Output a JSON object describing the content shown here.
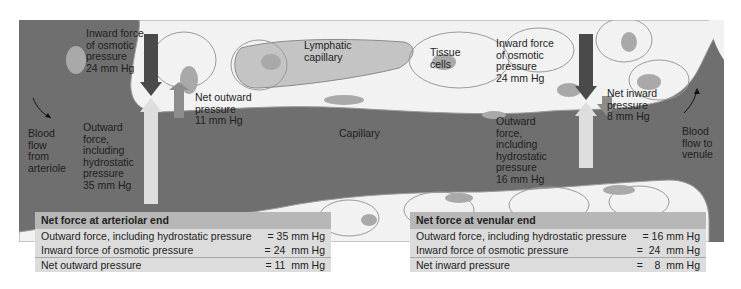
{
  "diagram": {
    "capillary_label": "Capillary",
    "lymphatic_label": "Lymphatic\ncapillary",
    "tissue_label": "Tissue\ncells",
    "blood_in_label": "Blood\nflow\nfrom\narteriole",
    "blood_out_label": "Blood\nflow to\nvenule",
    "arteriolar": {
      "inward_label": "Inward force\nof osmotic\npressure\n24 mm Hg",
      "outward_label": "Outward\nforce,\nincluding\nhydrostatic\npressure\n35 mm Hg",
      "net_label": "Net outward\npressure\n11 mm Hg"
    },
    "venular": {
      "inward_label": "Inward force\nof osmotic\npressure\n24 mm Hg",
      "outward_label": "Outward\nforce,\nincluding\nhydrostatic\npressure\n16 mm Hg",
      "net_label": "Net inward\npressure\n8 mm Hg"
    },
    "colors": {
      "capillary": "#6f6f6f",
      "tissue": "#f2f2f2",
      "nucleus": "#a9a9a9",
      "inward_arrow": "#4a4a4a",
      "outward_arrow": "#dedede",
      "net_arrow": "#8c8c8c",
      "table_bg": "#dcdcdc",
      "table_header": "#b7b7b7"
    }
  },
  "tables": {
    "arteriolar": {
      "title": "Net force at arteriolar end",
      "rows": [
        {
          "label": "Outward force, including hydrostatic pressure",
          "value": "= 35 mm Hg"
        },
        {
          "label": "Inward force of osmotic pressure",
          "value": "= 24  mm Hg"
        },
        {
          "label": "Net outward pressure",
          "value": "= 11  mm Hg"
        }
      ]
    },
    "venular": {
      "title": "Net force at venular end",
      "rows": [
        {
          "label": "Outward force, including hydrostatic pressure",
          "value": "= 16 mm Hg"
        },
        {
          "label": "Inward force of osmotic pressure",
          "value": "=  24  mm Hg"
        },
        {
          "label": "Net inward pressure",
          "value": "=    8  mm Hg"
        }
      ]
    }
  }
}
